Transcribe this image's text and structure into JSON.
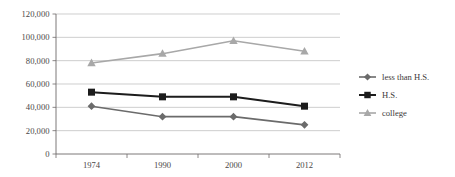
{
  "chart_data": {
    "type": "line",
    "title": "",
    "subtitle": "",
    "xlabel": "",
    "ylabel": "",
    "categories": [
      "1974",
      "1990",
      "2000",
      "2012"
    ],
    "ylim": [
      0,
      120000
    ],
    "ytick_step": 20000,
    "ytick_labels": [
      "0",
      "20,000",
      "40,000",
      "60,000",
      "80,000",
      "100,000",
      "120,000"
    ],
    "ytick_values": [
      0,
      20000,
      40000,
      60000,
      80000,
      100000,
      120000
    ],
    "grid": true,
    "grid_axis": "y",
    "legend_position": "right",
    "series": [
      {
        "name": "less than H.S.",
        "marker": "diamond",
        "color": "#6b6b6b",
        "values": [
          41000,
          32000,
          32000,
          25000
        ]
      },
      {
        "name": "H.S.",
        "marker": "square",
        "color": "#1c1c1c",
        "values": [
          53000,
          49000,
          49000,
          41000
        ]
      },
      {
        "name": "college",
        "marker": "triangle",
        "color": "#a8a8a8",
        "values": [
          78000,
          86000,
          97000,
          88000
        ]
      }
    ]
  },
  "legend": {
    "entries": [
      {
        "label": "less than H.S."
      },
      {
        "label": "H.S."
      },
      {
        "label": "college"
      }
    ]
  },
  "colors": {
    "series_less_than_hs": "#6b6b6b",
    "series_hs": "#1c1c1c",
    "series_college": "#a8a8a8",
    "gridline": "#b9b9b9",
    "axis": "#6e6a6a",
    "text": "#3d3a3a",
    "background": "#ffffff"
  }
}
